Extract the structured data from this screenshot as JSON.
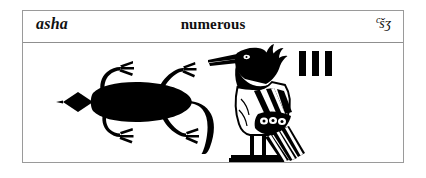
{
  "card": {
    "word_romanized": "asha",
    "meaning": "numerous",
    "transliteration_superscript": "c",
    "transliteration_body": "šʒ",
    "transliteration_full": "cšʒ"
  },
  "glyphs": [
    {
      "name": "lizard-glyph",
      "label": "lizard",
      "gardiner_sign": "I1",
      "fill": "#000000"
    },
    {
      "name": "crested-bird-glyph",
      "label": "crested bird",
      "gardiner_sign": "G25",
      "fill": "#000000"
    },
    {
      "name": "plural-strokes-glyph",
      "label": "three vertical strokes",
      "stroke_count": 3,
      "fill": "#000000"
    }
  ],
  "colors": {
    "background": "#ffffff",
    "ink": "#000000",
    "border": "#9a9a9a",
    "divider": "#8f8f8f",
    "text": "#111111"
  }
}
